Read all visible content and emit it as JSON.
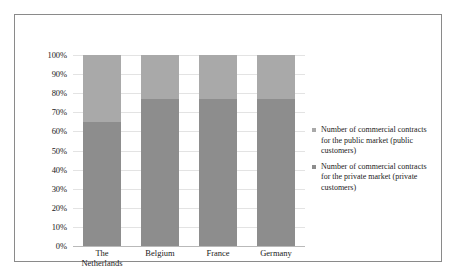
{
  "chart_data": {
    "type": "bar",
    "subtype": "stacked-100-percent",
    "title": "",
    "xlabel": "",
    "ylabel": "",
    "categories": [
      "The Netherlands",
      "Belgium",
      "France",
      "Germany"
    ],
    "category_lines": [
      [
        "The",
        "Netherlands"
      ],
      [
        "Belgium"
      ],
      [
        "France"
      ],
      [
        "Germany"
      ]
    ],
    "series": [
      {
        "name": "Number of commercial contracts for the private market (private customers)",
        "legend_lines": [
          "Number of commercial contracts",
          "for the private market (private",
          "customers)"
        ],
        "color": "#8d8d8d",
        "values": [
          65,
          77,
          77,
          77
        ],
        "stack_order": 0
      },
      {
        "name": "Number of commercial contracts for the public market (public customers)",
        "legend_lines": [
          "Number of commercial contracts",
          "for the public market (public",
          "customers)"
        ],
        "color": "#a9a9a9",
        "values": [
          35,
          23,
          23,
          23
        ],
        "stack_order": 1
      }
    ],
    "ylim": [
      0,
      100
    ],
    "yticks": [
      0,
      10,
      20,
      30,
      40,
      50,
      60,
      70,
      80,
      90,
      100
    ],
    "ytick_labels": [
      "0%",
      "10%",
      "20%",
      "30%",
      "40%",
      "50%",
      "60%",
      "70%",
      "80%",
      "90%",
      "100%"
    ],
    "grid": true,
    "legend_position": "right",
    "legend_order": [
      "public",
      "private"
    ],
    "colors": {
      "public_market": "#a9a9a9",
      "private_market": "#8d8d8d",
      "gridline": "#e3e3e3",
      "frame_border": "#8a8a8a",
      "text": "#1a1a1a",
      "background": "#ffffff"
    }
  }
}
